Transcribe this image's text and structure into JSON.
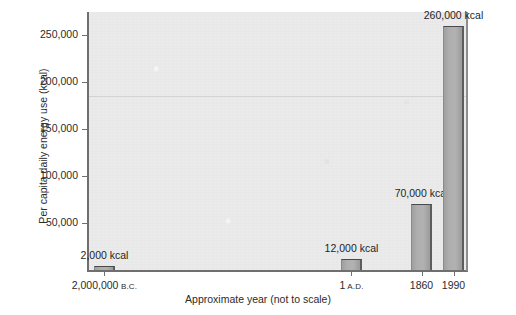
{
  "chart_data": {
    "type": "bar",
    "title": "",
    "subtitle": "",
    "xlabel": "Approximate year (not to scale)",
    "ylabel": "Per capita daily energy use (kcal)",
    "categories": [
      "2,000,000 B.C.",
      "1 A.D.",
      "1860",
      "1990"
    ],
    "category_parts": [
      {
        "number": "2,000,000",
        "era": "B.C."
      },
      {
        "number": "1",
        "era": "A.D."
      },
      {
        "number": "1860",
        "era": ""
      },
      {
        "number": "1990",
        "era": ""
      }
    ],
    "values": [
      2000,
      12000,
      70000,
      260000
    ],
    "data_labels": [
      "2,000 kcal",
      "12,000 kcal",
      "70,000 kcal",
      "260,000 kcal"
    ],
    "ylim": [
      0,
      275000
    ],
    "yticks": [
      50000,
      100000,
      150000,
      200000,
      250000
    ],
    "ytick_labels": [
      "50,000",
      "100,000",
      "150,000",
      "200,000",
      "250,000"
    ],
    "grid": false,
    "legend": null,
    "bar_color": "#a9a9a9",
    "bar_edge_color": "#4a4a4a",
    "panel_color": "#e9e9e9",
    "page_color": "#ffffff",
    "axis_color": "#6f6f6f",
    "text_color": "#2b2b2b",
    "artifact_line_value": 185000,
    "bar_x_fractions": [
      0.0158,
      0.6675,
      0.8523,
      0.9367
    ],
    "bar_width_px": 21
  }
}
